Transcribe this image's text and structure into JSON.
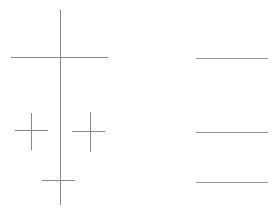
{
  "canvas": {
    "width": 275,
    "height": 212,
    "background_color": "#ffffff",
    "stroke_color": "#8a8a8a",
    "stroke_color_light": "#a6a6a6",
    "stroke_width": 1
  },
  "chart_data": {
    "type": "line",
    "title": "",
    "subtitle": "",
    "xlabel": "",
    "ylabel": "",
    "xlim": [
      0,
      275
    ],
    "ylim": [
      0,
      212
    ],
    "grid": false,
    "legend": null,
    "groups": [
      {
        "name": "left-registration-group",
        "label": "Crosshair marks",
        "segments": [
          {
            "name": "long-vertical-axis",
            "orientation": "vertical",
            "x1": 60,
            "y1": 10,
            "x2": 60,
            "y2": 205,
            "length": 195,
            "color": "#8a8a8a"
          },
          {
            "name": "long-horizontal-axis",
            "orientation": "horizontal",
            "x1": 11,
            "y1": 57,
            "x2": 108,
            "y2": 57,
            "length": 97,
            "color": "#8a8a8a"
          },
          {
            "name": "small-cross-left-horizontal",
            "orientation": "horizontal",
            "x1": 15,
            "y1": 130,
            "x2": 48,
            "y2": 130,
            "length": 33,
            "color": "#8a8a8a"
          },
          {
            "name": "small-cross-left-vertical",
            "orientation": "vertical",
            "x1": 31,
            "y1": 113,
            "x2": 31,
            "y2": 150,
            "length": 37,
            "color": "#8a8a8a"
          },
          {
            "name": "small-cross-right-horizontal",
            "orientation": "horizontal",
            "x1": 72,
            "y1": 131,
            "x2": 105,
            "y2": 131,
            "length": 33,
            "color": "#8a8a8a"
          },
          {
            "name": "small-cross-right-vertical",
            "orientation": "vertical",
            "x1": 90,
            "y1": 112,
            "x2": 90,
            "y2": 152,
            "length": 40,
            "color": "#8a8a8a"
          },
          {
            "name": "bottom-tick-horizontal",
            "orientation": "horizontal",
            "x1": 42,
            "y1": 180,
            "x2": 75,
            "y2": 180,
            "length": 33,
            "color": "#8a8a8a"
          }
        ],
        "intersections": [
          {
            "name": "main-crosshair-center",
            "x": 60,
            "y": 57
          },
          {
            "name": "small-cross-left-center",
            "x": 31,
            "y": 130
          },
          {
            "name": "small-cross-right-center",
            "x": 90,
            "y": 131
          },
          {
            "name": "bottom-tick-center",
            "x": 60,
            "y": 180
          }
        ]
      },
      {
        "name": "right-rules-group",
        "label": "Horizontal rules",
        "segments": [
          {
            "name": "rule-top",
            "orientation": "horizontal",
            "x1": 196,
            "y1": 58,
            "x2": 268,
            "y2": 58,
            "length": 72,
            "color": "#9a9a9a"
          },
          {
            "name": "rule-middle",
            "orientation": "horizontal",
            "x1": 196,
            "y1": 132,
            "x2": 268,
            "y2": 132,
            "length": 72,
            "color": "#9a9a9a"
          },
          {
            "name": "rule-bottom",
            "orientation": "horizontal",
            "x1": 196,
            "y1": 182,
            "x2": 268,
            "y2": 182,
            "length": 72,
            "color": "#9a9a9a"
          }
        ],
        "intersections": []
      }
    ]
  }
}
